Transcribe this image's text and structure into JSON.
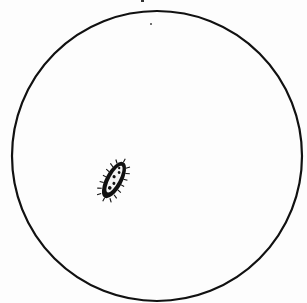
{
  "figure": {
    "field_of_view": {
      "shape": "circle",
      "center": [
        157,
        156
      ],
      "radius": 145,
      "stroke": "#111111",
      "stroke_width": 2.2
    },
    "specimen": {
      "label": "paramecium",
      "position": [
        114,
        180
      ],
      "length": 40,
      "width": 16,
      "rotation_deg": -62,
      "color": "#111111"
    },
    "marks": [
      {
        "type": "dot",
        "position": [
          151,
          24
        ]
      },
      {
        "type": "dot",
        "position": [
          142,
          1
        ]
      }
    ],
    "background": "#fdfdfd"
  }
}
